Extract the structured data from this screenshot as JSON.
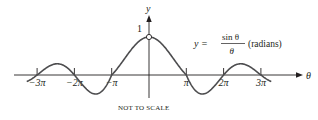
{
  "chart_data": {
    "type": "line",
    "title": "",
    "function_label": {
      "lhs": "y =",
      "numerator": "sin θ",
      "denominator": "θ",
      "suffix": "(radians)"
    },
    "xlabel": "θ",
    "ylabel": "y",
    "x_ticks": [
      {
        "value": -9.42478,
        "label": "−3π"
      },
      {
        "value": -6.28319,
        "label": "−2π"
      },
      {
        "value": -3.14159,
        "label": "−π"
      },
      {
        "value": 3.14159,
        "label": "π"
      },
      {
        "value": 6.28319,
        "label": "2π"
      },
      {
        "value": 9.42478,
        "label": "3π"
      }
    ],
    "y_ticks": [
      {
        "value": 1,
        "label": "1"
      }
    ],
    "xlim": [
      -10.3,
      10.3
    ],
    "ylim": [
      -0.4,
      1.5
    ],
    "open_point": {
      "x": 0,
      "y": 1
    },
    "series": [
      {
        "name": "sin(θ)/θ",
        "function": "sin(x)/x",
        "exaggerated_amplitude": true
      }
    ],
    "grid": false,
    "annotation": "NOT TO SCALE"
  }
}
